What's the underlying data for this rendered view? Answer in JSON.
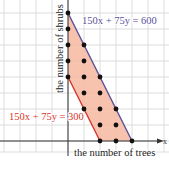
{
  "chart_data": {
    "type": "scatter",
    "title": "",
    "xlabel": "the number of trees",
    "ylabel": "the number of shrubs",
    "xlim": [
      -4,
      6
    ],
    "ylim": [
      -1,
      8.7
    ],
    "grid": true,
    "lines": [
      {
        "label": "150x + 75y = 600",
        "color": "#5a4f9a",
        "from": [
          0,
          8
        ],
        "to": [
          4,
          0
        ]
      },
      {
        "label": "150x + 75y = 300",
        "color": "#d9342b",
        "from": [
          0,
          4
        ],
        "to": [
          2,
          0
        ]
      }
    ],
    "shaded_region": {
      "description": "300 <= 150x + 75y <= 600, x >= 0, y >= 0",
      "color": "#f6b9a0",
      "vertices": [
        [
          0,
          4
        ],
        [
          0,
          8
        ],
        [
          4,
          0
        ],
        [
          2,
          0
        ]
      ]
    },
    "points": [
      [
        0,
        4
      ],
      [
        0,
        5
      ],
      [
        0,
        6
      ],
      [
        0,
        7
      ],
      [
        0,
        8
      ],
      [
        1,
        2
      ],
      [
        1,
        3
      ],
      [
        1,
        4
      ],
      [
        1,
        5
      ],
      [
        1,
        6
      ],
      [
        2,
        0
      ],
      [
        2,
        1
      ],
      [
        2,
        2
      ],
      [
        2,
        3
      ],
      [
        2,
        4
      ],
      [
        3,
        0
      ],
      [
        3,
        1
      ],
      [
        3,
        2
      ],
      [
        4,
        0
      ]
    ]
  },
  "labels": {
    "line_upper": "150x + 75y = 600",
    "line_lower": "150x + 75y = 300",
    "x_axis": "the number of trees",
    "y_axis": "the number of shrubs",
    "x_axis_end": "x"
  },
  "colors": {
    "grid": "#d4d4d4",
    "axis": "#333333",
    "region": "#f6b9a0",
    "upper_line": "#5a4f9a",
    "lower_line": "#d9342b",
    "upper_label": "#5a4f9a",
    "lower_label": "#d9342b",
    "point": "#111111"
  }
}
